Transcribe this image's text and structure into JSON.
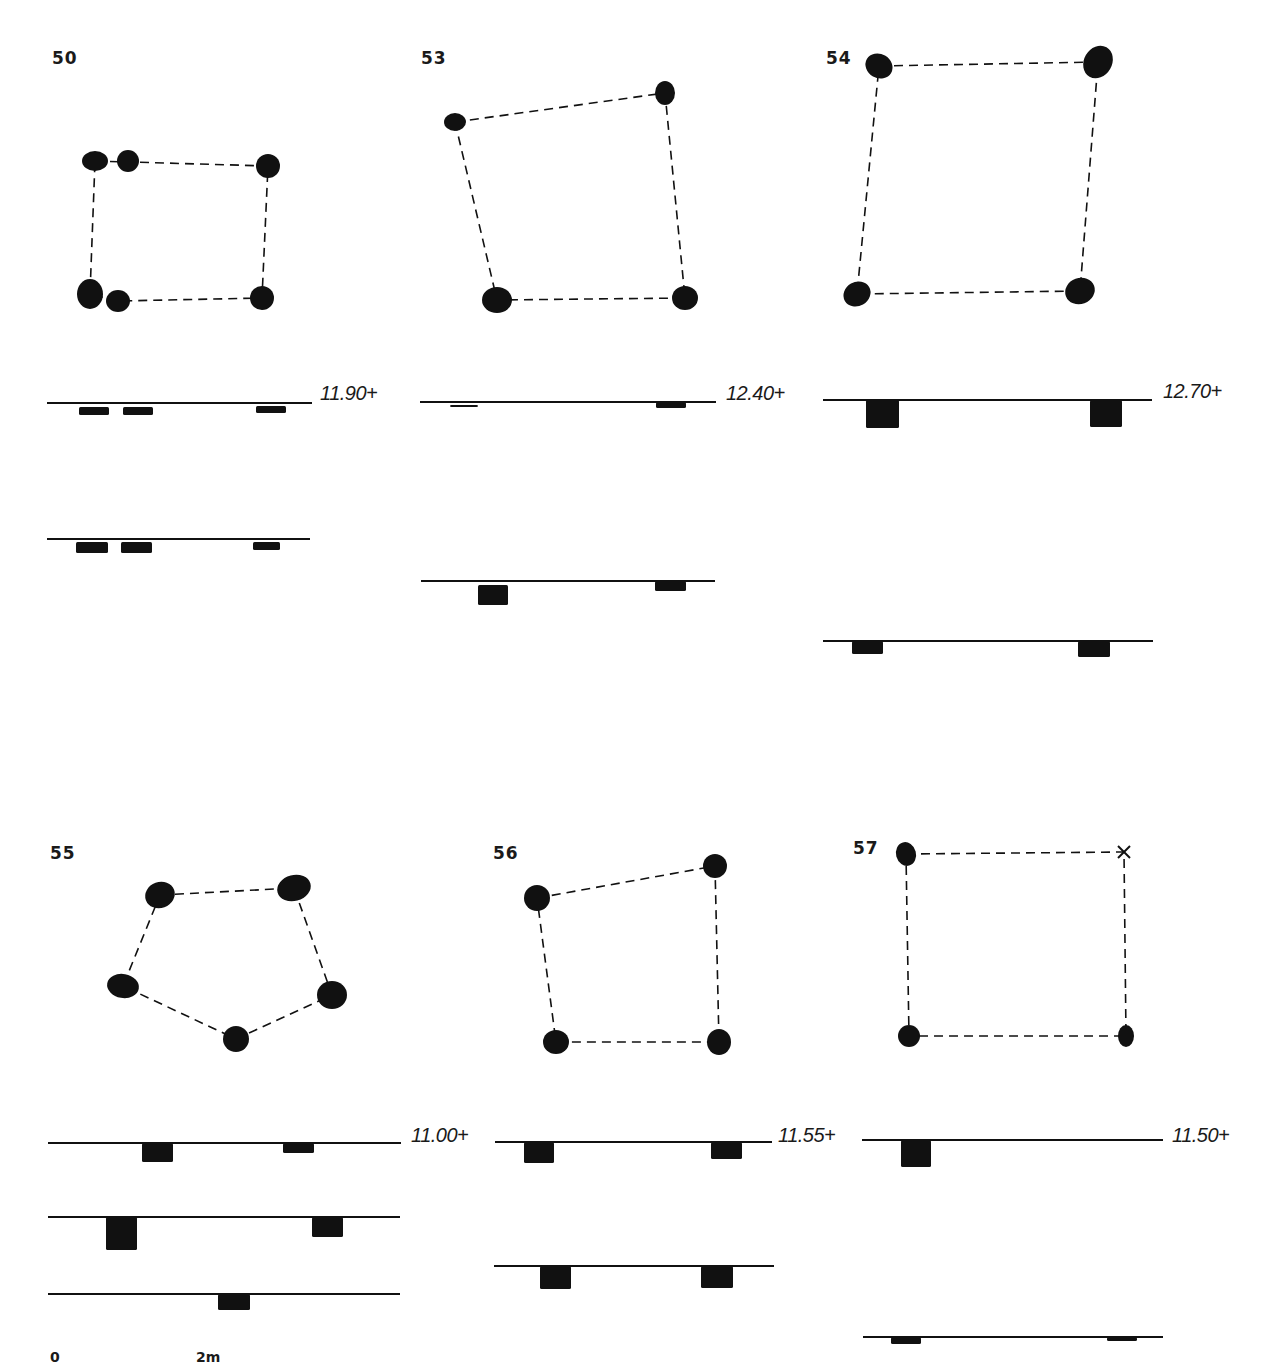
{
  "plate": {
    "ink_color": "#111111",
    "background": "#ffffff",
    "scale_bar": {
      "labels": [
        {
          "text": "0",
          "x": 50,
          "y": 1349
        },
        {
          "text": "2m",
          "x": 196,
          "y": 1349
        }
      ]
    },
    "structures": [
      {
        "id": "50",
        "label": {
          "text": "50",
          "x": 52,
          "y": 48
        },
        "posts": [
          {
            "cx": 95,
            "cy": 161,
            "rx": 13,
            "ry": 10
          },
          {
            "cx": 128,
            "cy": 161,
            "rx": 11,
            "ry": 11
          },
          {
            "cx": 268,
            "cy": 166,
            "rx": 12,
            "ry": 12
          },
          {
            "cx": 90,
            "cy": 294,
            "rx": 13,
            "ry": 15
          },
          {
            "cx": 118,
            "cy": 301,
            "rx": 12,
            "ry": 11
          },
          {
            "cx": 262,
            "cy": 298,
            "rx": 12,
            "ry": 12
          }
        ],
        "outline": [
          [
            95,
            161
          ],
          [
            268,
            166
          ],
          [
            262,
            298
          ],
          [
            118,
            301
          ],
          [
            90,
            294
          ],
          [
            95,
            161
          ]
        ],
        "elevation": {
          "text": "11.90+",
          "x": 320,
          "y": 382
        },
        "sections": [
          {
            "x1": 47,
            "x2": 312,
            "y": 403,
            "pits": [
              {
                "x": 79,
                "w": 30,
                "h": 8,
                "off": 4
              },
              {
                "x": 123,
                "w": 30,
                "h": 8,
                "off": 4
              },
              {
                "x": 256,
                "w": 30,
                "h": 7,
                "off": 3
              }
            ]
          },
          {
            "x1": 47,
            "x2": 310,
            "y": 539,
            "pits": [
              {
                "x": 76,
                "w": 32,
                "h": 11,
                "off": 3
              },
              {
                "x": 121,
                "w": 31,
                "h": 11,
                "off": 3
              },
              {
                "x": 253,
                "w": 27,
                "h": 8,
                "off": 3
              }
            ]
          }
        ]
      },
      {
        "id": "53",
        "label": {
          "text": "53",
          "x": 421,
          "y": 48
        },
        "posts": [
          {
            "cx": 455,
            "cy": 122,
            "rx": 11,
            "ry": 9
          },
          {
            "cx": 665,
            "cy": 93,
            "rx": 10,
            "ry": 12
          },
          {
            "cx": 497,
            "cy": 300,
            "rx": 15,
            "ry": 13
          },
          {
            "cx": 685,
            "cy": 298,
            "rx": 13,
            "ry": 12
          }
        ],
        "outline": [
          [
            455,
            122
          ],
          [
            665,
            93
          ],
          [
            685,
            298
          ],
          [
            497,
            300
          ],
          [
            455,
            122
          ]
        ],
        "elevation": {
          "text": "12.40+",
          "x": 726,
          "y": 382
        },
        "sections": [
          {
            "x1": 420,
            "x2": 716,
            "y": 402,
            "pits": [
              {
                "x": 450,
                "w": 28,
                "h": 2,
                "off": 3
              },
              {
                "x": 656,
                "w": 30,
                "h": 6,
                "off": 0
              }
            ]
          },
          {
            "x1": 421,
            "x2": 715,
            "y": 581,
            "pits": [
              {
                "x": 478,
                "w": 30,
                "h": 20,
                "off": 4
              },
              {
                "x": 655,
                "w": 31,
                "h": 10,
                "off": 0
              }
            ]
          }
        ]
      },
      {
        "id": "54",
        "label": {
          "text": "54",
          "x": 826,
          "y": 48
        },
        "posts": [
          {
            "cx": 879,
            "cy": 66,
            "rx": 14,
            "ry": 12,
            "rot": 30
          },
          {
            "cx": 1098,
            "cy": 62,
            "rx": 14,
            "ry": 17,
            "rot": 30
          },
          {
            "cx": 857,
            "cy": 294,
            "rx": 14,
            "ry": 12,
            "rot": -30
          },
          {
            "cx": 1080,
            "cy": 291,
            "rx": 15,
            "ry": 13,
            "rot": -20
          }
        ],
        "outline": [
          [
            879,
            66
          ],
          [
            1098,
            62
          ],
          [
            1080,
            291
          ],
          [
            857,
            294
          ],
          [
            879,
            66
          ]
        ],
        "elevation": {
          "text": "12.70+",
          "x": 1163,
          "y": 380
        },
        "sections": [
          {
            "x1": 823,
            "x2": 1152,
            "y": 400,
            "pits": [
              {
                "x": 866,
                "w": 33,
                "h": 28,
                "off": 0
              },
              {
                "x": 1090,
                "w": 32,
                "h": 27,
                "off": 0
              }
            ]
          },
          {
            "x1": 823,
            "x2": 1153,
            "y": 641,
            "pits": [
              {
                "x": 852,
                "w": 31,
                "h": 13,
                "off": 0
              },
              {
                "x": 1078,
                "w": 32,
                "h": 16,
                "off": 0
              }
            ]
          }
        ]
      },
      {
        "id": "55",
        "label": {
          "text": "55",
          "x": 50,
          "y": 843
        },
        "posts": [
          {
            "cx": 160,
            "cy": 895,
            "rx": 15,
            "ry": 13,
            "rot": -20
          },
          {
            "cx": 294,
            "cy": 888,
            "rx": 17,
            "ry": 13,
            "rot": -15
          },
          {
            "cx": 123,
            "cy": 986,
            "rx": 16,
            "ry": 12,
            "rot": 10
          },
          {
            "cx": 332,
            "cy": 995,
            "rx": 15,
            "ry": 14
          },
          {
            "cx": 236,
            "cy": 1039,
            "rx": 13,
            "ry": 13
          }
        ],
        "outline": [
          [
            160,
            895
          ],
          [
            294,
            888
          ],
          [
            332,
            995
          ],
          [
            236,
            1039
          ],
          [
            123,
            986
          ],
          [
            160,
            895
          ]
        ],
        "elevation": {
          "text": "11.00+",
          "x": 411,
          "y": 1124
        },
        "sections": [
          {
            "x1": 48,
            "x2": 401,
            "y": 1143,
            "pits": [
              {
                "x": 142,
                "w": 31,
                "h": 19,
                "off": 0
              },
              {
                "x": 283,
                "w": 31,
                "h": 10,
                "off": 0
              }
            ]
          },
          {
            "x1": 48,
            "x2": 400,
            "y": 1217,
            "pits": [
              {
                "x": 106,
                "w": 31,
                "h": 33,
                "off": 0
              },
              {
                "x": 312,
                "w": 31,
                "h": 20,
                "off": 0
              }
            ]
          },
          {
            "x1": 48,
            "x2": 400,
            "y": 1294,
            "pits": [
              {
                "x": 218,
                "w": 32,
                "h": 16,
                "off": 0
              }
            ]
          }
        ]
      },
      {
        "id": "56",
        "label": {
          "text": "56",
          "x": 493,
          "y": 843
        },
        "posts": [
          {
            "cx": 537,
            "cy": 898,
            "rx": 13,
            "ry": 13
          },
          {
            "cx": 715,
            "cy": 866,
            "rx": 12,
            "ry": 12
          },
          {
            "cx": 556,
            "cy": 1042,
            "rx": 13,
            "ry": 12
          },
          {
            "cx": 719,
            "cy": 1042,
            "rx": 12,
            "ry": 13
          }
        ],
        "outline": [
          [
            537,
            898
          ],
          [
            715,
            866
          ],
          [
            719,
            1042
          ],
          [
            556,
            1042
          ],
          [
            537,
            898
          ]
        ],
        "elevation": {
          "text": "11.55+",
          "x": 778,
          "y": 1124
        },
        "sections": [
          {
            "x1": 495,
            "x2": 772,
            "y": 1142,
            "pits": [
              {
                "x": 524,
                "w": 30,
                "h": 21,
                "off": 0
              },
              {
                "x": 711,
                "w": 31,
                "h": 17,
                "off": 0
              }
            ]
          },
          {
            "x1": 494,
            "x2": 774,
            "y": 1266,
            "pits": [
              {
                "x": 540,
                "w": 31,
                "h": 23,
                "off": 0
              },
              {
                "x": 701,
                "w": 32,
                "h": 22,
                "off": 0
              }
            ]
          }
        ]
      },
      {
        "id": "57",
        "label": {
          "text": "57",
          "x": 853,
          "y": 838
        },
        "posts": [
          {
            "cx": 906,
            "cy": 854,
            "rx": 10,
            "ry": 12,
            "rot": -15
          },
          {
            "cx": 909,
            "cy": 1036,
            "rx": 11,
            "ry": 11
          },
          {
            "cx": 1126,
            "cy": 1036,
            "rx": 8,
            "ry": 11
          }
        ],
        "markers": [
          {
            "type": "x-mark",
            "x": 1124,
            "y": 852
          }
        ],
        "outline": [
          [
            906,
            854
          ],
          [
            1124,
            852
          ],
          [
            1126,
            1036
          ],
          [
            909,
            1036
          ],
          [
            906,
            854
          ]
        ],
        "elevation": {
          "text": "11.50+",
          "x": 1172,
          "y": 1124
        },
        "sections": [
          {
            "x1": 862,
            "x2": 1163,
            "y": 1140,
            "pits": [
              {
                "x": 901,
                "w": 30,
                "h": 27,
                "off": 0
              }
            ]
          },
          {
            "x1": 863,
            "x2": 1163,
            "y": 1337,
            "pits": [
              {
                "x": 891,
                "w": 30,
                "h": 7,
                "off": 0
              },
              {
                "x": 1107,
                "w": 30,
                "h": 4,
                "off": 0
              }
            ]
          }
        ]
      }
    ]
  }
}
